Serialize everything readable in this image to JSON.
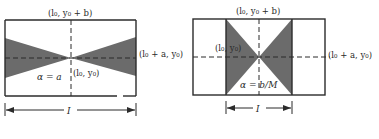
{
  "figure": {
    "colors": {
      "background": "#ffffff",
      "line": "#2b2b2b",
      "shade": "#6b6b6b"
    },
    "panels": [
      {
        "name": "left-panel",
        "top_label": "(l₀, y₀ + b)",
        "right_label": "(l₀ + a, y₀)",
        "center_label": "(l₀, y₀)",
        "alpha_label": "α = a",
        "dimension_label": "I"
      },
      {
        "name": "right-panel",
        "top_label": "(l₀, y₀ + b)",
        "right_label": "(l₀ + a, y₀)",
        "center_label": "(l₀, y₀)",
        "alpha_label": "α = b/M",
        "dimension_label": "I"
      }
    ]
  }
}
